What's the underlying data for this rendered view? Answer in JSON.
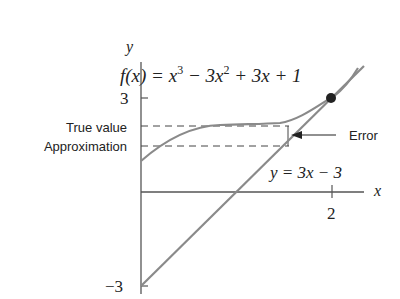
{
  "diagram": {
    "axis_labels": {
      "x": "x",
      "y": "y"
    },
    "ticks": {
      "y_top": "3",
      "y_bottom": "−3",
      "x_tick": "2"
    },
    "function_label": {
      "f": "f",
      "rest": "(x) = x",
      "sup1": "3",
      "mid": " − 3x",
      "sup2": "2",
      "end": " + 3x + 1"
    },
    "tangent_label": "y = 3x − 3",
    "annotations": {
      "true_value": "True value",
      "approximation": "Approximation",
      "error": "Error"
    },
    "colors": {
      "curve": "#8a8a8a",
      "axis": "#555555",
      "dot": "#222222",
      "text": "#222222"
    }
  }
}
